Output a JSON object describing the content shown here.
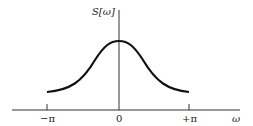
{
  "diagram": {
    "y_axis_label": "S[ω]",
    "x_axis_label": "ω",
    "ticks": [
      {
        "label": "−π",
        "value": "-pi"
      },
      {
        "label": "0",
        "value": "0"
      },
      {
        "label": "+π",
        "value": "+pi"
      }
    ],
    "curve": "bell-shaped spectral density peaking at ω=0, decaying toward ±π",
    "colors": {
      "line": "#111111",
      "axis": "#333333"
    }
  }
}
